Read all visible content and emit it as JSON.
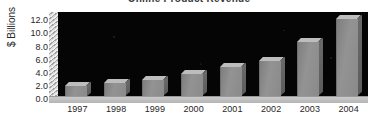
{
  "chart_data": {
    "type": "bar",
    "title": "Online Product Revenue",
    "xlabel": "",
    "ylabel": "$ Billions",
    "categories": [
      "1997",
      "1998",
      "1999",
      "2000",
      "2001",
      "2002",
      "2003",
      "2004"
    ],
    "values": [
      1.6,
      2.0,
      2.4,
      3.3,
      4.4,
      5.4,
      8.3,
      11.7
    ],
    "ytick_labels": [
      "0.0",
      "2.0",
      "4.0",
      "6.0",
      "8.0",
      "10.0",
      "12.0"
    ],
    "ytick_values": [
      0,
      2,
      4,
      6,
      8,
      10,
      12
    ],
    "ylim": [
      0,
      12.8
    ],
    "grid": false,
    "legend": null,
    "style": "3d-bar",
    "plot_background": "#050505",
    "bar_color": "#8a8a8a",
    "bar_top_color": "#bdbdbd",
    "bar_side_color": "#646464",
    "floor_color": "#c4c4c4",
    "text_color": "#1f1f1f"
  }
}
